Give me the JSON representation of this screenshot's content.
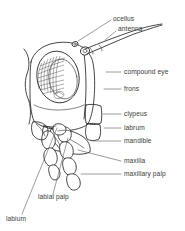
{
  "figure": {
    "view": "lateral",
    "background_color": "#ffffff",
    "ink_color": "#262626",
    "label_color": "#3a3a3a"
  },
  "labels": [
    {
      "id": "ocellus",
      "text": "ocellus",
      "x": 113,
      "y": 21,
      "anchor": "start"
    },
    {
      "id": "antenna",
      "text": "antenna",
      "x": 118,
      "y": 31,
      "anchor": "start"
    },
    {
      "id": "compound-eye",
      "text": "compound eye",
      "x": 124,
      "y": 74,
      "anchor": "start"
    },
    {
      "id": "frons",
      "text": "frons",
      "x": 124,
      "y": 91,
      "anchor": "start"
    },
    {
      "id": "clypeus",
      "text": "clypeus",
      "x": 124,
      "y": 116,
      "anchor": "start"
    },
    {
      "id": "labrum",
      "text": "labrum",
      "x": 124,
      "y": 130,
      "anchor": "start"
    },
    {
      "id": "mandible",
      "text": "mandible",
      "x": 124,
      "y": 143,
      "anchor": "start"
    },
    {
      "id": "maxilla",
      "text": "maxilla",
      "x": 124,
      "y": 163,
      "anchor": "start"
    },
    {
      "id": "maxillary-palp",
      "text": "maxillary palp",
      "x": 124,
      "y": 176,
      "anchor": "start"
    },
    {
      "id": "labial-palp",
      "text": "labial palp",
      "x": 38,
      "y": 199,
      "anchor": "start"
    },
    {
      "id": "labium",
      "text": "labium",
      "x": 6,
      "y": 221,
      "anchor": "start"
    }
  ],
  "leader_lines": [
    {
      "id": "leader-ocellus",
      "points": "111,20 86,36 78,41"
    },
    {
      "id": "leader-antenna",
      "points": "116,31 105,40"
    },
    {
      "id": "leader-compound-eye",
      "points": "121,72 106,72"
    },
    {
      "id": "leader-frons",
      "points": "121,89 104,89"
    },
    {
      "id": "leader-clypeus",
      "points": "121,114 103,114"
    },
    {
      "id": "leader-labrum",
      "points": "121,128 104,128"
    },
    {
      "id": "leader-mandible",
      "points": "121,141 92,141"
    },
    {
      "id": "leader-maxilla",
      "points": "121,161 78,150"
    },
    {
      "id": "leader-maxillary-palp",
      "points": "121,174 81,174"
    },
    {
      "id": "leader-labial-palp",
      "points": "53,194 68,138"
    },
    {
      "id": "leader-labium",
      "points": "22,214 57,128"
    }
  ],
  "anatomy_parts": [
    "ocellus",
    "antenna",
    "compound eye",
    "frons",
    "clypeus",
    "labrum",
    "mandible",
    "maxilla",
    "maxillary palp",
    "labial palp",
    "labium"
  ]
}
